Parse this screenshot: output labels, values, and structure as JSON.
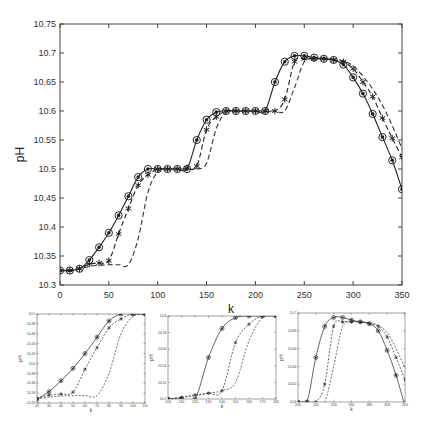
{
  "chart_data": [
    {
      "id": "main",
      "type": "line",
      "title": "",
      "xlabel": "k",
      "ylabel": "pH",
      "xlim": [
        0,
        350
      ],
      "ylim": [
        10.3,
        10.75
      ],
      "xticks": [
        0,
        50,
        100,
        150,
        200,
        250,
        300,
        350
      ],
      "xtick_labels": [
        "0",
        "50",
        "100",
        "150",
        "200",
        "250",
        "300",
        "350"
      ],
      "yticks": [
        10.3,
        10.35,
        10.4,
        10.45,
        10.5,
        10.55,
        10.6,
        10.65,
        10.7,
        10.75
      ],
      "ytick_labels": [
        "10.3",
        "10.35",
        "10.4",
        "10.45",
        "10.5",
        "10.55",
        "10.6",
        "10.65",
        "10.7",
        "10.75"
      ],
      "grid": false,
      "legend": null,
      "x": [
        0,
        10,
        20,
        30,
        40,
        50,
        60,
        70,
        80,
        90,
        100,
        110,
        120,
        130,
        140,
        150,
        160,
        170,
        180,
        190,
        200,
        210,
        220,
        230,
        240,
        250,
        260,
        270,
        280,
        290,
        300,
        310,
        320,
        330,
        340,
        350
      ],
      "series": [
        {
          "name": "solid-circle",
          "style": "solid",
          "marker": "circle-dot",
          "values": [
            10.325,
            10.325,
            10.328,
            10.343,
            10.365,
            10.39,
            10.42,
            10.453,
            10.486,
            10.5,
            10.5,
            10.5,
            10.5,
            10.5,
            10.55,
            10.585,
            10.598,
            10.6,
            10.6,
            10.6,
            10.6,
            10.6,
            10.65,
            10.685,
            10.695,
            10.695,
            10.692,
            10.69,
            10.688,
            10.68,
            10.658,
            10.63,
            10.595,
            10.555,
            10.515,
            10.465
          ]
        },
        {
          "name": "dashed-asterisk",
          "style": "dashed",
          "marker": "asterisk",
          "values": [
            10.325,
            10.325,
            10.328,
            10.336,
            10.338,
            10.342,
            10.388,
            10.432,
            10.472,
            10.49,
            10.5,
            10.5,
            10.5,
            10.502,
            10.505,
            10.568,
            10.59,
            10.6,
            10.6,
            10.6,
            10.6,
            10.6,
            10.6,
            10.62,
            10.685,
            10.69,
            10.69,
            10.69,
            10.688,
            10.685,
            10.673,
            10.65,
            10.625,
            10.588,
            10.553,
            10.52
          ]
        },
        {
          "name": "dashed-reference",
          "style": "dashed",
          "marker": "none",
          "values": [
            10.325,
            10.326,
            10.328,
            10.332,
            10.334,
            10.335,
            10.335,
            10.335,
            10.38,
            10.46,
            10.495,
            10.5,
            10.5,
            10.5,
            10.5,
            10.51,
            10.57,
            10.598,
            10.6,
            10.6,
            10.6,
            10.6,
            10.6,
            10.6,
            10.64,
            10.685,
            10.69,
            10.69,
            10.689,
            10.686,
            10.678,
            10.66,
            10.638,
            10.61,
            10.575,
            10.535
          ]
        }
      ]
    },
    {
      "id": "inset-1",
      "type": "line",
      "xlabel": "k",
      "ylabel": "pH",
      "xlim": [
        20,
        110
      ],
      "ylim": [
        10.32,
        10.5
      ],
      "xtick_labels": [
        "20",
        "30",
        "40",
        "50",
        "60",
        "70",
        "80",
        "90",
        "100",
        "110"
      ],
      "ytick_labels": [
        "10.32",
        "10.34",
        "10.36",
        "10.38",
        "10.4",
        "10.42",
        "10.44",
        "10.46",
        "10.48",
        "10.5"
      ],
      "x": [
        20,
        30,
        40,
        50,
        60,
        70,
        80,
        90,
        100,
        110
      ],
      "series": [
        {
          "name": "solid-circle",
          "values": [
            10.328,
            10.343,
            10.365,
            10.39,
            10.42,
            10.453,
            10.486,
            10.5,
            10.5,
            10.5
          ]
        },
        {
          "name": "dashed-asterisk",
          "values": [
            10.328,
            10.336,
            10.338,
            10.342,
            10.388,
            10.432,
            10.472,
            10.49,
            10.5,
            10.5
          ]
        },
        {
          "name": "dashed-reference",
          "values": [
            10.328,
            10.332,
            10.334,
            10.335,
            10.335,
            10.335,
            10.38,
            10.46,
            10.495,
            10.5
          ]
        }
      ]
    },
    {
      "id": "inset-2",
      "type": "line",
      "xlabel": "k",
      "ylabel": "pH",
      "xlim": [
        100,
        180
      ],
      "ylim": [
        10.5,
        10.6
      ],
      "xtick_labels": [
        "100",
        "110",
        "120",
        "130",
        "140",
        "150",
        "160",
        "170",
        "180"
      ],
      "ytick_labels": [
        "10.5",
        "10.52",
        "10.54",
        "10.56",
        "10.58",
        "10.6"
      ],
      "x": [
        100,
        110,
        120,
        130,
        140,
        150,
        160,
        170,
        180
      ],
      "series": [
        {
          "name": "solid-circle",
          "values": [
            10.5,
            10.5,
            10.5,
            10.55,
            10.585,
            10.598,
            10.6,
            10.6,
            10.6
          ]
        },
        {
          "name": "dashed-asterisk",
          "values": [
            10.5,
            10.502,
            10.505,
            10.507,
            10.51,
            10.568,
            10.59,
            10.6,
            10.6
          ]
        },
        {
          "name": "dashed-reference",
          "values": [
            10.5,
            10.502,
            10.504,
            10.507,
            10.51,
            10.52,
            10.57,
            10.598,
            10.6
          ]
        }
      ]
    },
    {
      "id": "inset-3",
      "type": "line",
      "xlabel": "k",
      "ylabel": "pH",
      "xlim": [
        200,
        320
      ],
      "ylim": [
        10.6,
        10.7
      ],
      "xtick_labels": [
        "200",
        "220",
        "240",
        "260",
        "280",
        "300",
        "320"
      ],
      "ytick_labels": [
        "10.6",
        "10.62",
        "10.64",
        "10.66",
        "10.68",
        "10.7"
      ],
      "x": [
        200,
        210,
        220,
        230,
        240,
        250,
        260,
        270,
        280,
        290,
        300,
        310,
        320
      ],
      "series": [
        {
          "name": "solid-circle",
          "values": [
            10.6,
            10.6,
            10.65,
            10.685,
            10.695,
            10.695,
            10.692,
            10.69,
            10.688,
            10.68,
            10.658,
            10.63,
            10.595
          ]
        },
        {
          "name": "dashed-asterisk",
          "values": [
            10.6,
            10.6,
            10.6,
            10.62,
            10.685,
            10.69,
            10.69,
            10.69,
            10.688,
            10.685,
            10.673,
            10.65,
            10.625
          ]
        },
        {
          "name": "dashed-reference",
          "values": [
            10.6,
            10.6,
            10.6,
            10.6,
            10.64,
            10.685,
            10.69,
            10.69,
            10.689,
            10.686,
            10.678,
            10.66,
            10.638
          ]
        }
      ]
    }
  ]
}
